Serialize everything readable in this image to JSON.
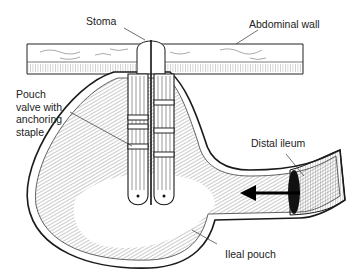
{
  "figure": {
    "colors": {
      "line": "#1a1a1a",
      "background": "#ffffff",
      "text": "#222222"
    }
  },
  "labels": {
    "stoma": "Stoma",
    "abdominal_wall": "Abdominal wall",
    "pouch_valve": "Pouch\nvalve with\nanchoring\nstaple",
    "distal_ileum": "Distal ileum",
    "ileal_pouch": "Ileal pouch"
  },
  "annotations": {
    "flow_arrow": "arrow-left"
  }
}
